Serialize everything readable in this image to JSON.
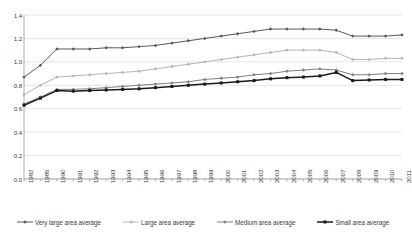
{
  "chart_data": {
    "type": "line",
    "title": "",
    "xlabel": "",
    "ylabel": "",
    "ylim": [
      0.0,
      1.4
    ],
    "ytick_step": 0.2,
    "yticks": [
      "0.0",
      "0.2",
      "0.4",
      "0.6",
      "0.8",
      "1.0",
      "1.2",
      "1.4"
    ],
    "grid": "horizontal",
    "legend_position": "bottom",
    "categories": [
      "1982",
      "1985",
      "1990",
      "1991",
      "1992",
      "1993",
      "1994",
      "1995",
      "1996",
      "1997",
      "1998",
      "1999",
      "2000",
      "2001",
      "2002",
      "2003",
      "2004",
      "2005",
      "2006",
      "2007",
      "2008",
      "2009",
      "2010",
      "2011"
    ],
    "series": [
      {
        "name": "Very large area average",
        "color": "#595959",
        "marker": "diamond",
        "values": [
          0.87,
          0.97,
          1.11,
          1.11,
          1.11,
          1.12,
          1.12,
          1.13,
          1.14,
          1.16,
          1.18,
          1.2,
          1.22,
          1.24,
          1.26,
          1.28,
          1.28,
          1.28,
          1.28,
          1.27,
          1.22,
          1.22,
          1.22,
          1.23
        ]
      },
      {
        "name": "Large area average",
        "color": "#b5b5b5",
        "marker": "diamond",
        "values": [
          0.72,
          0.8,
          0.87,
          0.88,
          0.89,
          0.9,
          0.91,
          0.92,
          0.94,
          0.96,
          0.98,
          1.0,
          1.02,
          1.04,
          1.06,
          1.08,
          1.1,
          1.1,
          1.1,
          1.08,
          1.02,
          1.02,
          1.03,
          1.03
        ]
      },
      {
        "name": "Medium area average",
        "color": "#7f7f7f",
        "marker": "diamond",
        "values": [
          0.64,
          0.7,
          0.765,
          0.765,
          0.77,
          0.78,
          0.79,
          0.8,
          0.81,
          0.82,
          0.83,
          0.85,
          0.86,
          0.87,
          0.89,
          0.9,
          0.92,
          0.93,
          0.94,
          0.93,
          0.89,
          0.89,
          0.9,
          0.9
        ]
      },
      {
        "name": "Small area average",
        "color": "#1a1a1a",
        "marker": "square",
        "values": [
          0.63,
          0.69,
          0.755,
          0.75,
          0.755,
          0.76,
          0.765,
          0.77,
          0.78,
          0.79,
          0.8,
          0.81,
          0.82,
          0.83,
          0.84,
          0.855,
          0.865,
          0.87,
          0.88,
          0.91,
          0.84,
          0.845,
          0.85,
          0.85
        ]
      }
    ]
  },
  "plot": {
    "left": 24,
    "right": 402,
    "top": 15,
    "bottom": 179,
    "grid_color": "#d9d9d9",
    "axis_color": "#9a9a9a",
    "background": "#ffffff"
  }
}
